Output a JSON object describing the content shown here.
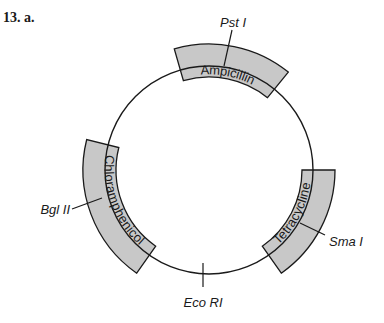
{
  "question_label": "13. a.",
  "plasmid": {
    "center": [
      209,
      170
    ],
    "radius": 104,
    "genes": [
      {
        "name": "Ampicillin",
        "start_deg": -106,
        "end_deg": -51
      },
      {
        "name": "Chloramphenicol",
        "start_deg": 125,
        "end_deg": 194
      },
      {
        "name": "Tetracycline",
        "start_deg": 0,
        "end_deg": 55
      }
    ],
    "restriction_sites": [
      {
        "name": "Pst I"
      },
      {
        "name": "Bgl II"
      },
      {
        "name": "Sma I"
      },
      {
        "name": "Eco RI"
      }
    ]
  },
  "colors": {
    "band_fill": "#c8c8c8",
    "line": "#1a1a1a"
  }
}
